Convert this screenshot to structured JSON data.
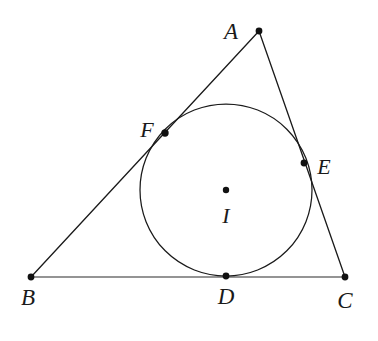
{
  "figure": {
    "type": "geometry-diagram",
    "width": 378,
    "height": 341,
    "background_color": "#ffffff",
    "stroke_color": "#1a1a1a",
    "point_color": "#111111"
  },
  "labels": {
    "A": "A",
    "B": "B",
    "C": "C",
    "D": "D",
    "E": "E",
    "F": "F",
    "I": "I"
  },
  "geometry": {
    "triangle": {
      "name": "ABC",
      "vertices": [
        {
          "id": "A",
          "x": 259,
          "y": 31
        },
        {
          "id": "B",
          "x": 31,
          "y": 277
        },
        {
          "id": "C",
          "x": 345,
          "y": 277
        }
      ],
      "sides": [
        {
          "id": "AB",
          "from": "A",
          "to": "B"
        },
        {
          "id": "AC",
          "from": "A",
          "to": "C"
        },
        {
          "id": "BC",
          "from": "B",
          "to": "C"
        }
      ]
    },
    "incircle": {
      "center": {
        "id": "I",
        "x": 226,
        "y": 190
      },
      "radius": 86
    },
    "tangent_points": [
      {
        "id": "D",
        "x": 226,
        "y": 276,
        "on_side": "BC"
      },
      {
        "id": "E",
        "x": 304,
        "y": 163,
        "on_side": "AC"
      },
      {
        "id": "F",
        "x": 165,
        "y": 133,
        "on_side": "AB"
      }
    ],
    "label_positions": [
      {
        "id": "A",
        "x": 231,
        "y": 31
      },
      {
        "id": "B",
        "x": 28,
        "y": 297
      },
      {
        "id": "C",
        "x": 345,
        "y": 300
      },
      {
        "id": "D",
        "x": 226,
        "y": 296
      },
      {
        "id": "E",
        "x": 324,
        "y": 167
      },
      {
        "id": "F",
        "x": 147,
        "y": 130
      },
      {
        "id": "I",
        "x": 226,
        "y": 216
      }
    ]
  }
}
